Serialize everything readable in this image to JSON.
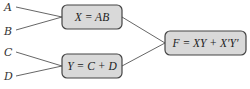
{
  "inputs": [
    "A",
    "B",
    "C",
    "D"
  ],
  "nodes": {
    "x": {
      "expr": "X = AB"
    },
    "y": {
      "expr": "Y = C + D"
    },
    "f": {
      "expr": "F = XY + X′Y′"
    }
  },
  "colors": {
    "box_fill": "#d9d9d9",
    "box_stroke": "#444444",
    "wire": "#555555"
  }
}
